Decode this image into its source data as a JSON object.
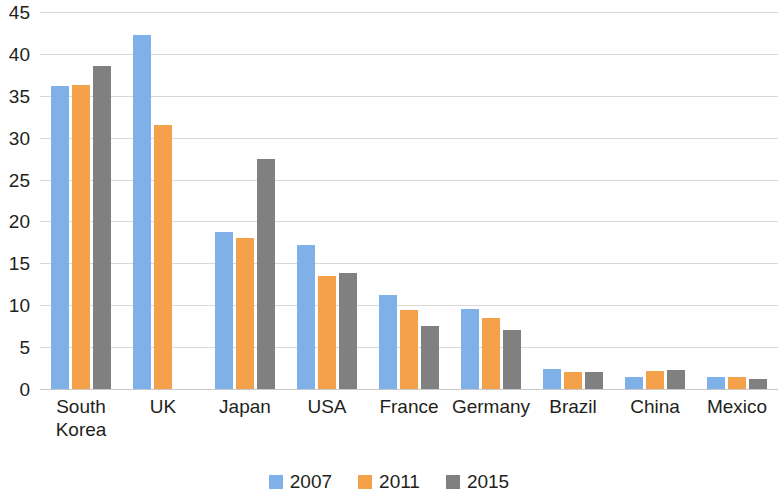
{
  "chart_data": {
    "type": "bar",
    "title": "",
    "subtitle": "",
    "xlabel": "",
    "ylabel": "",
    "ylim": [
      0,
      45
    ],
    "ytick_step": 5,
    "yticks": [
      0,
      5,
      10,
      15,
      20,
      25,
      30,
      35,
      40,
      45
    ],
    "ytick_labels": [
      "0",
      "5",
      "10",
      "15",
      "20",
      "25",
      "30",
      "35",
      "40",
      "45"
    ],
    "grid": true,
    "legend_position": "bottom-center",
    "categories": [
      "South\nKorea",
      "UK",
      "Japan",
      "USA",
      "France",
      "Germany",
      "Brazil",
      "China",
      "Mexico"
    ],
    "category_labels": [
      "South\nKorea",
      "UK",
      "Japan",
      "USA",
      "France",
      "Germany",
      "Brazil",
      "China",
      "Mexico"
    ],
    "series": [
      {
        "name": "2007",
        "color": "#7fb1e8",
        "values": [
          36.2,
          42.3,
          18.8,
          17.2,
          11.2,
          9.5,
          2.4,
          1.4,
          1.4
        ]
      },
      {
        "name": "2011",
        "color": "#f5a04b",
        "values": [
          36.3,
          31.5,
          18.0,
          13.5,
          9.4,
          8.5,
          2.0,
          2.1,
          1.4
        ]
      },
      {
        "name": "2015",
        "color": "#808080",
        "values": [
          38.5,
          null,
          27.5,
          13.8,
          7.5,
          7.0,
          2.0,
          2.3,
          1.2
        ]
      }
    ]
  },
  "legend": {
    "entries": [
      {
        "label": "2007",
        "color": "#7fb1e8"
      },
      {
        "label": "2011",
        "color": "#f5a04b"
      },
      {
        "label": "2015",
        "color": "#808080"
      }
    ]
  },
  "colors": {
    "series_2007": "#7fb1e8",
    "series_2011": "#f5a04b",
    "series_2015": "#808080",
    "gridline": "#d9d9d9",
    "text": "#231f20",
    "background": "#ffffff"
  }
}
